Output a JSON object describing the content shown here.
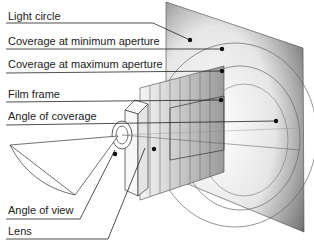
{
  "diagram": {
    "labels": [
      {
        "id": "light-circle",
        "text": "Light circle"
      },
      {
        "id": "coverage-min",
        "text": "Coverage at minimum aperture"
      },
      {
        "id": "coverage-max",
        "text": "Coverage at maximum aperture"
      },
      {
        "id": "film-frame",
        "text": "Film frame"
      },
      {
        "id": "angle-coverage",
        "text": "Angle of coverage"
      },
      {
        "id": "angle-view",
        "text": "Angle of view"
      },
      {
        "id": "lens",
        "text": "Lens"
      }
    ],
    "colors": {
      "line": "#333333",
      "text": "#222222",
      "plane_dark": "#6e6e6e",
      "plane_light": "#f2f2f2"
    }
  }
}
